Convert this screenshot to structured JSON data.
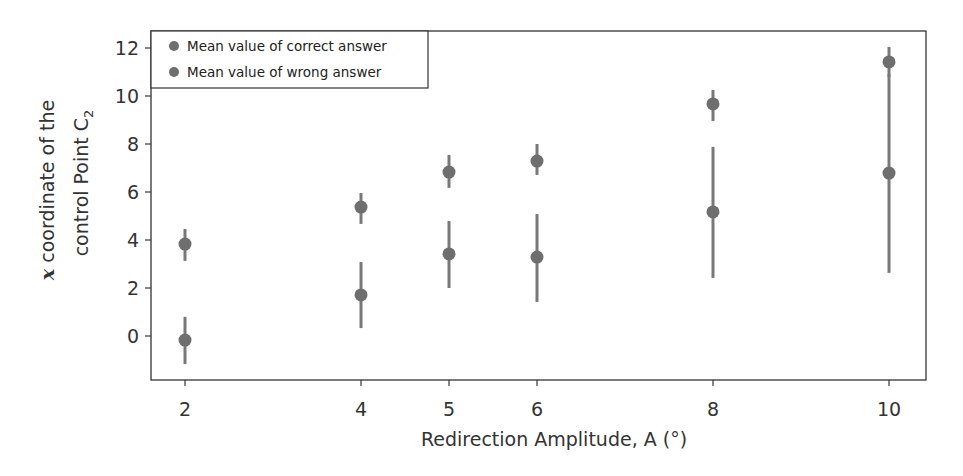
{
  "chart_data": {
    "type": "scatter",
    "title": "",
    "xlabel": "Redirection Amplitude, A (°)",
    "ylabel_line1": "x coordinate of the",
    "ylabel_line1_italic": "x",
    "ylabel_line1_rest": " coordinate of the",
    "ylabel_line2": "control Point C",
    "ylabel_line2_sub": "2",
    "x_ticks": [
      2,
      4,
      5,
      6,
      8,
      10
    ],
    "x_tick_labels": [
      "2",
      "4",
      "5",
      "6",
      "8",
      "10"
    ],
    "y_ticks": [
      0,
      2,
      4,
      6,
      8,
      10,
      12
    ],
    "y_tick_labels": [
      "0",
      "2",
      "4",
      "6",
      "8",
      "10",
      "12"
    ],
    "xlim": [
      1.6,
      10.4
    ],
    "ylim": [
      -1.8,
      12.6
    ],
    "grid": false,
    "legend_position": "upper left",
    "series": [
      {
        "name": "Mean value of correct answer",
        "color": "#6e6e6e",
        "x": [
          2,
          4,
          5,
          6,
          8,
          10
        ],
        "y": [
          3.83,
          5.37,
          6.83,
          7.29,
          9.67,
          11.42
        ],
        "err_low": [
          3.13,
          4.67,
          6.17,
          6.71,
          8.96,
          10.8
        ],
        "err_high": [
          4.46,
          5.96,
          7.54,
          8.0,
          10.25,
          12.04
        ]
      },
      {
        "name": "Mean value of wrong answer",
        "color": "#6e6e6e",
        "x": [
          2,
          4,
          5,
          6,
          8,
          10
        ],
        "y": [
          -0.17,
          1.71,
          3.42,
          3.29,
          5.17,
          6.79
        ],
        "err_low": [
          -1.17,
          0.33,
          2.0,
          1.42,
          2.42,
          2.63
        ],
        "err_high": [
          0.8,
          3.08,
          4.79,
          5.08,
          7.88,
          10.9
        ]
      }
    ]
  },
  "legend": {
    "items": [
      {
        "label": "Mean value of correct answer",
        "color": "#6e6e6e"
      },
      {
        "label": "Mean value of wrong answer",
        "color": "#6e6e6e"
      }
    ]
  },
  "style": {
    "errorbar_color": "#787878",
    "frame_color": "#333333"
  }
}
